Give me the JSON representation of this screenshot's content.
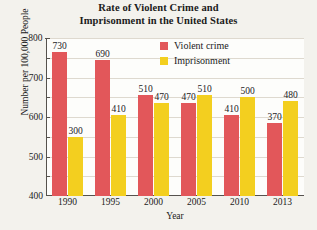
{
  "chart_data": {
    "type": "bar",
    "title": "Rate of Violent Crime and Imprisonment in the United States",
    "title_lines": [
      "Rate of Violent Crime and",
      "Imprisonment in the United States"
    ],
    "xlabel": "Year",
    "ylabel": "Number per 100,000 People",
    "categories": [
      "1990",
      "1995",
      "2000",
      "2005",
      "2010",
      "2013"
    ],
    "series": [
      {
        "name": "Violent crime",
        "color": "#e2575a",
        "values": [
          730,
          690,
          510,
          470,
          410,
          370
        ]
      },
      {
        "name": "Imprisonment",
        "color": "#f3cf1f",
        "values": [
          300,
          410,
          470,
          510,
          500,
          480
        ]
      }
    ],
    "ylim": [
      0,
      800
    ],
    "ytick_values": [
      100,
      200,
      300,
      400,
      500,
      600,
      700,
      800
    ],
    "ytick_labels": [
      "100",
      "200",
      "300",
      "400",
      "500",
      "600",
      "700",
      "800"
    ],
    "grid": true,
    "legend_position": "inside-top-right"
  },
  "legend": {
    "items": [
      {
        "label": "Violent crime",
        "color": "#e2575a"
      },
      {
        "label": "Imprisonment",
        "color": "#f3cf1f"
      }
    ]
  },
  "colors": {
    "violent_crime": "#e2575a",
    "imprisonment": "#f3cf1f",
    "page_background": "#f3f2ed",
    "plot_background": "#fdfdfb",
    "axis": "#55524d",
    "gridline": "#ded9cf"
  }
}
